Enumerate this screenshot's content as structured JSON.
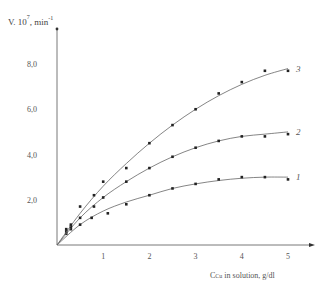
{
  "chart_data": {
    "type": "scatter",
    "title": "",
    "ylabel": "V. 10^7, min^-1",
    "ylabel_main": "V. 10",
    "ylabel_exp": "7",
    "ylabel_unit": ", min",
    "ylabel_unit_exp": "-1",
    "xlabel": "C_Cu in solution, g/dl",
    "xlabel_sub_main": "C",
    "xlabel_sub": "Cu",
    "xlabel_rest": " in solution, g/dl",
    "xlim": [
      0,
      5.5
    ],
    "ylim": [
      0,
      9
    ],
    "x_ticks": [
      "1",
      "2",
      "3",
      "4",
      "5"
    ],
    "y_ticks": [
      "2,0",
      "4,0",
      "6,0",
      "8,0"
    ],
    "grid": false,
    "legend": "curve numbers at right end",
    "series": [
      {
        "name": "1",
        "x": [
          0.2,
          0.3,
          0.5,
          0.75,
          1.1,
          1.5,
          2.0,
          2.5,
          3.0,
          3.5,
          4.0,
          4.5,
          5.0
        ],
        "y": [
          0.5,
          0.7,
          0.9,
          1.2,
          1.4,
          1.8,
          2.2,
          2.5,
          2.7,
          2.9,
          3.0,
          3.0,
          2.9
        ],
        "fit": [
          [
            0,
            0
          ],
          [
            0.5,
            0.9
          ],
          [
            1,
            1.5
          ],
          [
            1.5,
            1.9
          ],
          [
            2,
            2.2
          ],
          [
            2.5,
            2.5
          ],
          [
            3,
            2.7
          ],
          [
            3.5,
            2.85
          ],
          [
            4,
            2.95
          ],
          [
            4.5,
            3.0
          ],
          [
            5,
            3.0
          ]
        ]
      },
      {
        "name": "2",
        "x": [
          0.2,
          0.3,
          0.5,
          0.8,
          1.0,
          1.5,
          2.0,
          2.5,
          3.0,
          3.5,
          4.0,
          4.5,
          5.0
        ],
        "y": [
          0.6,
          0.8,
          1.2,
          1.7,
          2.1,
          2.8,
          3.4,
          3.9,
          4.3,
          4.6,
          4.8,
          4.8,
          4.9
        ],
        "fit": [
          [
            0,
            0
          ],
          [
            0.5,
            1.2
          ],
          [
            1,
            2.1
          ],
          [
            1.5,
            2.8
          ],
          [
            2,
            3.4
          ],
          [
            2.5,
            3.9
          ],
          [
            3,
            4.3
          ],
          [
            3.5,
            4.6
          ],
          [
            4,
            4.8
          ],
          [
            4.5,
            4.9
          ],
          [
            5,
            5.0
          ]
        ]
      },
      {
        "name": "3",
        "x": [
          0.2,
          0.3,
          0.5,
          0.8,
          1.0,
          1.5,
          2.0,
          2.5,
          3.0,
          3.5,
          4.0,
          4.5,
          5.0
        ],
        "y": [
          0.7,
          0.9,
          1.7,
          2.2,
          2.8,
          3.4,
          4.5,
          5.3,
          6.0,
          6.7,
          7.2,
          7.7,
          7.7
        ],
        "fit": [
          [
            0,
            0
          ],
          [
            0.5,
            1.4
          ],
          [
            1,
            2.6
          ],
          [
            1.5,
            3.6
          ],
          [
            2,
            4.5
          ],
          [
            2.5,
            5.3
          ],
          [
            3,
            6.0
          ],
          [
            3.5,
            6.6
          ],
          [
            4,
            7.1
          ],
          [
            4.5,
            7.5
          ],
          [
            5,
            7.8
          ]
        ]
      }
    ]
  }
}
